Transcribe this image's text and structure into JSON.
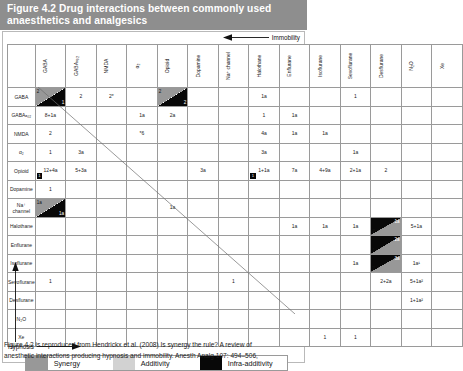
{
  "figure": {
    "title": "Figure 4.2  Drug interactions between commonly used anaesthetics and analgesics",
    "caption_line1": "Figure 4.2 is reproduced from Hendrickx et al. (2008) Is synergy the rule? A review of",
    "caption_line2": "anesthetic interactions producing hypnosis and immobility. Anesth Analg 107: 494–506,"
  },
  "axes": {
    "immobility_label": "Immobility",
    "hypnosis_label": "Hypnosis"
  },
  "legend": {
    "items": [
      {
        "label": "Synergy",
        "color": "#989898",
        "key": "syn"
      },
      {
        "label": "Additivity",
        "color": "#d2d2d2",
        "key": "add"
      },
      {
        "label": "Infra-additivity",
        "color": "#080808",
        "key": "infra"
      }
    ]
  },
  "matrix": {
    "columns": [
      "GABA",
      "GABAₐ₀₂",
      "NMDA",
      "α₂",
      "Opioid",
      "Dopamine",
      "Na⁺ channel",
      "Halothane",
      "Enflurane",
      "Isoflurane",
      "Sevoflurane",
      "Desflurane",
      "N₂O",
      "Xe"
    ],
    "rows": [
      "GABA",
      "GABAₐ₀₂",
      "NMDA",
      "α₂",
      "Opioid",
      "Dopamine",
      "Na⁺ channel",
      "Halothane",
      "Enflurane",
      "Isoflurane",
      "Sevoflurane",
      "Desflurane",
      "N₂O",
      "Xe"
    ],
    "cells": [
      [
        {
          "c": "split-syn-infra",
          "a": "2",
          "b": "1"
        },
        {
          "c": "syn",
          "v": "2"
        },
        {
          "c": "add",
          "v": "2*"
        },
        {
          "c": "none",
          "v": ""
        },
        {
          "c": "split-syn-infra",
          "a": "2",
          "b": "2"
        },
        {
          "c": "none",
          "v": ""
        },
        {
          "c": "none",
          "v": ""
        },
        {
          "c": "syn",
          "v": "1a"
        },
        {
          "c": "none",
          "v": ""
        },
        {
          "c": "none",
          "v": ""
        },
        {
          "c": "add",
          "v": "1"
        },
        {
          "c": "none",
          "v": ""
        },
        {
          "c": "infra",
          "v": "3"
        },
        {
          "c": "none",
          "v": ""
        }
      ],
      [
        {
          "c": "syn",
          "v": "8+1a"
        },
        {
          "c": "none",
          "v": ""
        },
        {
          "c": "infra",
          "v": "1"
        },
        {
          "c": "add",
          "v": "1a"
        },
        {
          "c": "syn",
          "v": "2a"
        },
        {
          "c": "none",
          "v": ""
        },
        {
          "c": "none",
          "v": ""
        },
        {
          "c": "syn",
          "v": "1"
        },
        {
          "c": "syn",
          "v": "1a"
        },
        {
          "c": "none",
          "v": ""
        },
        {
          "c": "none",
          "v": ""
        },
        {
          "c": "none",
          "v": ""
        },
        {
          "c": "none",
          "v": ""
        },
        {
          "c": "none",
          "v": ""
        }
      ],
      [
        {
          "c": "add",
          "v": "2"
        },
        {
          "c": "infra",
          "v": "1"
        },
        {
          "c": "none",
          "v": ""
        },
        {
          "c": "add",
          "v": "*6"
        },
        {
          "c": "none",
          "v": ""
        },
        {
          "c": "none",
          "v": ""
        },
        {
          "c": "none",
          "v": ""
        },
        {
          "c": "syn",
          "v": "4a"
        },
        {
          "c": "syn",
          "v": "1a"
        },
        {
          "c": "syn",
          "v": "1a"
        },
        {
          "c": "none",
          "v": ""
        },
        {
          "c": "none",
          "v": ""
        },
        {
          "c": "none",
          "v": ""
        },
        {
          "c": "none",
          "v": ""
        }
      ],
      [
        {
          "c": "add",
          "v": "1"
        },
        {
          "c": "syn",
          "v": "3a"
        },
        {
          "c": "none",
          "v": ""
        },
        {
          "c": "none",
          "v": ""
        },
        {
          "c": "none",
          "v": ""
        },
        {
          "c": "none",
          "v": ""
        },
        {
          "c": "none",
          "v": ""
        },
        {
          "c": "syn",
          "v": "3a"
        },
        {
          "c": "none",
          "v": ""
        },
        {
          "c": "none",
          "v": ""
        },
        {
          "c": "syn",
          "v": "1a"
        },
        {
          "c": "none",
          "v": ""
        },
        {
          "c": "none",
          "v": ""
        },
        {
          "c": "none",
          "v": ""
        }
      ],
      [
        {
          "c": "syn-badge",
          "v": "12+4a",
          "badge": "1"
        },
        {
          "c": "syn",
          "v": "5+3a"
        },
        {
          "c": "none",
          "v": ""
        },
        {
          "c": "none",
          "v": ""
        },
        {
          "c": "none",
          "v": ""
        },
        {
          "c": "syn",
          "v": "3a"
        },
        {
          "c": "none",
          "v": ""
        },
        {
          "c": "syn-badge",
          "v": "1+1a",
          "badge": "1"
        },
        {
          "c": "syn",
          "v": "7a"
        },
        {
          "c": "syn",
          "v": "4+9a"
        },
        {
          "c": "syn",
          "v": "2+1a"
        },
        {
          "c": "syn",
          "v": "2"
        },
        {
          "c": "none",
          "v": ""
        },
        {
          "c": "none",
          "v": ""
        }
      ],
      [
        {
          "c": "syn",
          "v": "1"
        },
        {
          "c": "none",
          "v": ""
        },
        {
          "c": "none",
          "v": ""
        },
        {
          "c": "none",
          "v": ""
        },
        {
          "c": "none",
          "v": ""
        },
        {
          "c": "none",
          "v": ""
        },
        {
          "c": "none",
          "v": ""
        },
        {
          "c": "none",
          "v": ""
        },
        {
          "c": "none",
          "v": ""
        },
        {
          "c": "none",
          "v": ""
        },
        {
          "c": "none",
          "v": ""
        },
        {
          "c": "none",
          "v": ""
        },
        {
          "c": "none",
          "v": ""
        },
        {
          "c": "none",
          "v": ""
        }
      ],
      [
        {
          "c": "split-syn-infra",
          "a": "1a",
          "b": "1a"
        },
        {
          "c": "none",
          "v": ""
        },
        {
          "c": "none",
          "v": ""
        },
        {
          "c": "none",
          "v": ""
        },
        {
          "c": "syn",
          "v": "1a"
        },
        {
          "c": "none",
          "v": ""
        },
        {
          "c": "none",
          "v": ""
        },
        {
          "c": "none",
          "v": ""
        },
        {
          "c": "none",
          "v": ""
        },
        {
          "c": "none",
          "v": ""
        },
        {
          "c": "none",
          "v": ""
        },
        {
          "c": "none",
          "v": ""
        },
        {
          "c": "none",
          "v": ""
        },
        {
          "c": "none",
          "v": ""
        }
      ],
      [
        {
          "c": "none",
          "v": ""
        },
        {
          "c": "none",
          "v": ""
        },
        {
          "c": "none",
          "v": ""
        },
        {
          "c": "none",
          "v": ""
        },
        {
          "c": "none",
          "v": ""
        },
        {
          "c": "none",
          "v": ""
        },
        {
          "c": "none",
          "v": ""
        },
        {
          "c": "none",
          "v": ""
        },
        {
          "c": "add",
          "v": "1a"
        },
        {
          "c": "add",
          "v": "1a"
        },
        {
          "c": "add",
          "v": "1a"
        },
        {
          "c": "split-infra-num",
          "a": "1a",
          "b": "2"
        },
        {
          "c": "add",
          "v": "5+1a"
        },
        {
          "c": "none",
          "v": ""
        }
      ],
      [
        {
          "c": "none",
          "v": ""
        },
        {
          "c": "none",
          "v": ""
        },
        {
          "c": "none",
          "v": ""
        },
        {
          "c": "none",
          "v": ""
        },
        {
          "c": "none",
          "v": ""
        },
        {
          "c": "none",
          "v": ""
        },
        {
          "c": "none",
          "v": ""
        },
        {
          "c": "infra",
          "v": "1"
        },
        {
          "c": "none",
          "v": ""
        },
        {
          "c": "none",
          "v": ""
        },
        {
          "c": "none",
          "v": ""
        },
        {
          "c": "split-infra-num",
          "a": "2a",
          "b": "1"
        },
        {
          "c": "none",
          "v": ""
        },
        {
          "c": "none",
          "v": ""
        }
      ],
      [
        {
          "c": "none",
          "v": ""
        },
        {
          "c": "none",
          "v": ""
        },
        {
          "c": "none",
          "v": ""
        },
        {
          "c": "none",
          "v": ""
        },
        {
          "c": "none",
          "v": ""
        },
        {
          "c": "none",
          "v": ""
        },
        {
          "c": "none",
          "v": ""
        },
        {
          "c": "none",
          "v": ""
        },
        {
          "c": "none",
          "v": ""
        },
        {
          "c": "none",
          "v": ""
        },
        {
          "c": "add",
          "v": "1a"
        },
        {
          "c": "split-infra-num",
          "a": "3a",
          "b": "2"
        },
        {
          "c": "add",
          "v": "1a¹"
        },
        {
          "c": "none",
          "v": ""
        }
      ],
      [
        {
          "c": "add",
          "v": "1"
        },
        {
          "c": "none",
          "v": ""
        },
        {
          "c": "none",
          "v": ""
        },
        {
          "c": "none",
          "v": ""
        },
        {
          "c": "none",
          "v": ""
        },
        {
          "c": "none",
          "v": ""
        },
        {
          "c": "syn",
          "v": "1"
        },
        {
          "c": "infra",
          "v": "1"
        },
        {
          "c": "none",
          "v": ""
        },
        {
          "c": "none",
          "v": ""
        },
        {
          "c": "none",
          "v": ""
        },
        {
          "c": "add",
          "v": "2+2a"
        },
        {
          "c": "add",
          "v": "5+1a²"
        },
        {
          "c": "none",
          "v": ""
        }
      ],
      [
        {
          "c": "none",
          "v": ""
        },
        {
          "c": "none",
          "v": ""
        },
        {
          "c": "none",
          "v": ""
        },
        {
          "c": "none",
          "v": ""
        },
        {
          "c": "none",
          "v": ""
        },
        {
          "c": "none",
          "v": ""
        },
        {
          "c": "none",
          "v": ""
        },
        {
          "c": "none",
          "v": ""
        },
        {
          "c": "none",
          "v": ""
        },
        {
          "c": "none",
          "v": ""
        },
        {
          "c": "none",
          "v": ""
        },
        {
          "c": "none",
          "v": ""
        },
        {
          "c": "add",
          "v": "1+1a²"
        },
        {
          "c": "none",
          "v": ""
        }
      ],
      [
        {
          "c": "none",
          "v": ""
        },
        {
          "c": "none",
          "v": ""
        },
        {
          "c": "none",
          "v": ""
        },
        {
          "c": "none",
          "v": ""
        },
        {
          "c": "none",
          "v": ""
        },
        {
          "c": "none",
          "v": ""
        },
        {
          "c": "none",
          "v": ""
        },
        {
          "c": "none",
          "v": ""
        },
        {
          "c": "none",
          "v": ""
        },
        {
          "c": "infra",
          "v": "1"
        },
        {
          "c": "infra",
          "v": "2"
        },
        {
          "c": "none",
          "v": ""
        },
        {
          "c": "none",
          "v": ""
        },
        {
          "c": "none",
          "v": ""
        }
      ],
      [
        {
          "c": "none",
          "v": ""
        },
        {
          "c": "none",
          "v": ""
        },
        {
          "c": "none",
          "v": ""
        },
        {
          "c": "none",
          "v": ""
        },
        {
          "c": "none",
          "v": ""
        },
        {
          "c": "none",
          "v": ""
        },
        {
          "c": "none",
          "v": ""
        },
        {
          "c": "none",
          "v": ""
        },
        {
          "c": "none",
          "v": ""
        },
        {
          "c": "add",
          "v": "1"
        },
        {
          "c": "add",
          "v": "1"
        },
        {
          "c": "none",
          "v": ""
        },
        {
          "c": "none",
          "v": ""
        },
        {
          "c": "none",
          "v": ""
        }
      ]
    ]
  }
}
